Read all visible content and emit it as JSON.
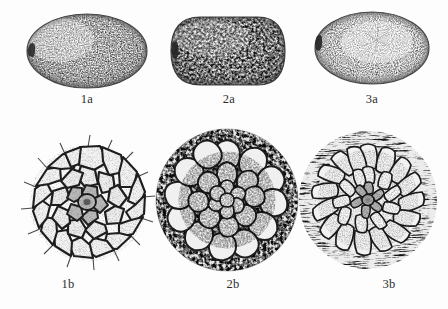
{
  "plate": {
    "background_color": "#fdfdfd",
    "ink_color": "#2c2c2c",
    "width": 448,
    "height": 309,
    "style": "scientific-line-drawing-stipple"
  },
  "rows": [
    {
      "id": "row-a",
      "description": "whole seed habit views"
    },
    {
      "id": "row-b",
      "description": "seed coat surface cell detail"
    }
  ],
  "figures": [
    {
      "id": "fig-1a",
      "label": "1a",
      "row": "a",
      "column": 1,
      "subject": "whole seed, broadly ovoid",
      "outline_shape": "ovoid",
      "texture": "fine stipple",
      "hilum_side": "left",
      "cx": 87,
      "cy": 51,
      "rx": 60,
      "ry": 37,
      "label_x": 87,
      "label_y": 99
    },
    {
      "id": "fig-2a",
      "label": "2a",
      "row": "a",
      "column": 2,
      "subject": "whole seed, oblong-rounded",
      "outline_shape": "oblong",
      "texture": "coarse reticulate stipple",
      "hilum_side": "left",
      "cx": 229,
      "cy": 51,
      "rx": 59,
      "ry": 34,
      "label_x": 229,
      "label_y": 99
    },
    {
      "id": "fig-3a",
      "label": "3a",
      "row": "a",
      "column": 3,
      "subject": "whole seed, broadly elliptic with notch",
      "outline_shape": "elliptic",
      "texture": "fine sparse stipple",
      "hilum_side": "left",
      "cx": 372,
      "cy": 48,
      "rx": 57,
      "ry": 36,
      "label_x": 372,
      "label_y": 99
    },
    {
      "id": "fig-1b",
      "label": "1b",
      "row": "b",
      "column": 1,
      "subject": "seed coat, polygonal cells radiating from micropyle",
      "cell_pattern": "polygonal",
      "cell_count_rings": 3,
      "cx": 88,
      "cy": 203,
      "r": 57,
      "label_x": 68,
      "label_y": 284
    },
    {
      "id": "fig-2b",
      "label": "2b",
      "row": "b",
      "column": 2,
      "subject": "seed coat, rosette of obovate cells with papillate margin",
      "cell_pattern": "obovate-rosette",
      "cell_count_rings": 3,
      "cx": 227,
      "cy": 200,
      "r": 70,
      "label_x": 233,
      "label_y": 284
    },
    {
      "id": "fig-3b",
      "label": "3b",
      "row": "b",
      "column": 3,
      "subject": "seed coat, columnar cells in dense radial rosette with hispid margin",
      "cell_pattern": "columnar-rosette",
      "cell_count_rings": 3,
      "cx": 368,
      "cy": 200,
      "r": 68,
      "label_x": 389,
      "label_y": 284
    }
  ],
  "caption": {
    "text": "",
    "visible": false,
    "note": "caption line clipped at image bottom edge"
  }
}
